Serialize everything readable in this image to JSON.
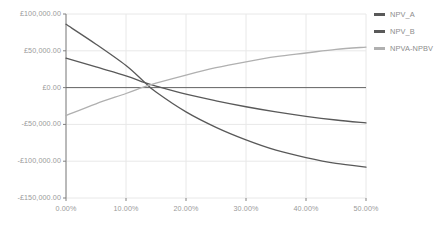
{
  "chart_data": {
    "type": "line",
    "title": "",
    "xlabel": "",
    "ylabel": "",
    "xlim": [
      0,
      50
    ],
    "ylim": [
      -150000,
      100000
    ],
    "grid": true,
    "legend_position": "right",
    "x_tick_labels": [
      "0.00%",
      "10.00%",
      "20.00%",
      "30.00%",
      "40.00%",
      "50.00%"
    ],
    "x_tick_values": [
      0,
      10,
      20,
      30,
      40,
      50
    ],
    "y_tick_labels": [
      "£100,000.00",
      "£50,000.00",
      "£0.00",
      "-£50,000.00",
      "-£100,000.00",
      "-£150,000.00"
    ],
    "y_tick_values": [
      100000,
      50000,
      0,
      -50000,
      -100000,
      -150000
    ],
    "x": [
      0,
      5,
      10,
      13,
      15,
      20,
      25,
      30,
      35,
      40,
      45,
      50
    ],
    "series": [
      {
        "name": "NPV_A",
        "color": "#595959",
        "values": [
          86000,
          59000,
          30000,
          8000,
          -6000,
          -33000,
          -54000,
          -71000,
          -85000,
          -95000,
          -103000,
          -108000
        ]
      },
      {
        "name": "NPV_B",
        "color": "#595959",
        "values": [
          40000,
          28000,
          16000,
          7000,
          2000,
          -9000,
          -18000,
          -26000,
          -33000,
          -39000,
          -44000,
          -48000
        ]
      },
      {
        "name": "NPVA-NPBV",
        "color": "#b0b0b0",
        "values": [
          -38000,
          -22000,
          -8000,
          1000,
          6000,
          17000,
          27000,
          35000,
          42000,
          47000,
          52000,
          55000
        ]
      }
    ]
  },
  "legend": {
    "items": [
      {
        "label": "NPV_A"
      },
      {
        "label": "NPV_B"
      },
      {
        "label": "NPVA-NPBV"
      }
    ]
  },
  "colors": {
    "axis": "#808080",
    "grid": "#e8e8e8",
    "zero_line": "#666666",
    "tick_text": "#9a9a9a",
    "legend_text": "#8d8d8d",
    "series_dark": "#595959",
    "series_light": "#b0b0b0",
    "background": "#ffffff"
  }
}
